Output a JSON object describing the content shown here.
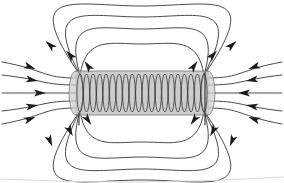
{
  "figure": {
    "caption": "",
    "background_color": "#ffffff",
    "line_color": "#2b2b2b",
    "arrow_color": "#1a1a1a",
    "coil_fill_color": "#b9b9b9",
    "coil_stroke_color": "#6a6a6a",
    "width_px": 284,
    "height_px": 183
  },
  "solenoid": {
    "label": "solenoid-coil",
    "center_x": 142,
    "center_y": 93,
    "half_length": 66,
    "half_height": 22,
    "turn_count": 20,
    "turn_spacing": 6.6,
    "turn_radius_y": 19,
    "turn_radius_x": 3.1,
    "lead_count": 2
  },
  "chart_data": {
    "type": "scatter",
    "xlabel": "",
    "ylabel": "",
    "grid": false,
    "legend": "none",
    "xlim": [
      0,
      284
    ],
    "ylim": [
      0,
      183
    ],
    "field_loops": [
      {
        "name": "loop-top-1",
        "rx": 56,
        "ry": 26,
        "cx": 142,
        "cy": 70,
        "half": "top"
      },
      {
        "name": "loop-top-2",
        "rx": 79,
        "ry": 41,
        "cx": 142,
        "cy": 70,
        "half": "top"
      },
      {
        "name": "loop-top-3",
        "rx": 101,
        "ry": 53,
        "cx": 142,
        "cy": 70,
        "half": "top"
      },
      {
        "name": "loop-top-4",
        "rx": 124,
        "ry": 64,
        "cx": 142,
        "cy": 70,
        "half": "top"
      },
      {
        "name": "loop-bottom-1",
        "rx": 56,
        "ry": 26,
        "cx": 142,
        "cy": 116,
        "half": "bottom"
      },
      {
        "name": "loop-bottom-2",
        "rx": 79,
        "ry": 41,
        "cx": 142,
        "cy": 116,
        "half": "bottom"
      },
      {
        "name": "loop-bottom-3",
        "rx": 101,
        "ry": 53,
        "cx": 142,
        "cy": 116,
        "half": "bottom"
      },
      {
        "name": "loop-bottom-4",
        "rx": 124,
        "ry": 64,
        "cx": 142,
        "cy": 116,
        "half": "bottom"
      }
    ],
    "straight_lines_left": [
      {
        "name": "straight-left-1",
        "y_edge": 78,
        "y_outer": 62
      },
      {
        "name": "straight-left-2",
        "y_edge": 85,
        "y_outer": 75
      },
      {
        "name": "straight-left-3",
        "y_edge": 93,
        "y_outer": 93
      },
      {
        "name": "straight-left-4",
        "y_edge": 101,
        "y_outer": 111
      },
      {
        "name": "straight-left-5",
        "y_edge": 108,
        "y_outer": 124
      }
    ],
    "straight_lines_right": [
      {
        "name": "straight-right-1",
        "y_edge": 78,
        "y_outer": 62
      },
      {
        "name": "straight-right-2",
        "y_edge": 85,
        "y_outer": 75
      },
      {
        "name": "straight-right-3",
        "y_edge": 93,
        "y_outer": 93
      },
      {
        "name": "straight-right-4",
        "y_edge": 101,
        "y_outer": 111
      },
      {
        "name": "straight-right-5",
        "y_edge": 108,
        "y_outer": 124
      }
    ],
    "arrow_annotations": [
      {
        "name": "arrow-left-straight-1",
        "x": 30,
        "y": 67,
        "angle": 20,
        "direction": "toward-solenoid"
      },
      {
        "name": "arrow-left-straight-2",
        "x": 32,
        "y": 80,
        "angle": 10,
        "direction": "toward-solenoid"
      },
      {
        "name": "arrow-left-straight-3",
        "x": 40,
        "y": 93,
        "angle": 0,
        "direction": "toward-solenoid"
      },
      {
        "name": "arrow-left-straight-4",
        "x": 32,
        "y": 106,
        "angle": -10,
        "direction": "toward-solenoid"
      },
      {
        "name": "arrow-left-straight-5",
        "x": 30,
        "y": 119,
        "angle": -20,
        "direction": "toward-solenoid"
      },
      {
        "name": "arrow-right-straight-1",
        "x": 254,
        "y": 67,
        "angle": 160,
        "direction": "toward-solenoid"
      },
      {
        "name": "arrow-right-straight-2",
        "x": 252,
        "y": 80,
        "angle": 170,
        "direction": "toward-solenoid"
      },
      {
        "name": "arrow-right-straight-3",
        "x": 244,
        "y": 93,
        "angle": 180,
        "direction": "toward-solenoid"
      },
      {
        "name": "arrow-right-straight-4",
        "x": 252,
        "y": 106,
        "angle": 190,
        "direction": "toward-solenoid"
      },
      {
        "name": "arrow-right-straight-5",
        "x": 254,
        "y": 119,
        "angle": 200,
        "direction": "toward-solenoid"
      },
      {
        "name": "arrow-loop-top-1-left",
        "x": 88,
        "y": 66,
        "angle": 235,
        "direction": "clockwise"
      },
      {
        "name": "arrow-loop-top-1-right",
        "x": 194,
        "y": 66,
        "angle": 305,
        "direction": "clockwise"
      },
      {
        "name": "arrow-loop-top-2-left",
        "x": 70,
        "y": 55,
        "angle": 228,
        "direction": "clockwise"
      },
      {
        "name": "arrow-loop-top-2-right",
        "x": 213,
        "y": 55,
        "angle": 312,
        "direction": "clockwise"
      },
      {
        "name": "arrow-loop-top-3-left",
        "x": 50,
        "y": 45,
        "angle": 222,
        "direction": "clockwise"
      },
      {
        "name": "arrow-loop-top-3-right",
        "x": 232,
        "y": 45,
        "angle": 318,
        "direction": "clockwise"
      },
      {
        "name": "arrow-loop-bottom-1-left",
        "x": 88,
        "y": 120,
        "angle": 55,
        "direction": "clockwise"
      },
      {
        "name": "arrow-loop-bottom-1-right",
        "x": 194,
        "y": 120,
        "angle": 125,
        "direction": "clockwise"
      },
      {
        "name": "arrow-loop-bottom-2-left",
        "x": 70,
        "y": 131,
        "angle": 62,
        "direction": "clockwise"
      },
      {
        "name": "arrow-loop-bottom-2-right",
        "x": 213,
        "y": 131,
        "angle": 118,
        "direction": "clockwise"
      },
      {
        "name": "arrow-loop-bottom-3-left",
        "x": 50,
        "y": 141,
        "angle": 68,
        "direction": "clockwise"
      },
      {
        "name": "arrow-loop-bottom-3-right",
        "x": 232,
        "y": 141,
        "angle": 112,
        "direction": "clockwise"
      }
    ]
  }
}
